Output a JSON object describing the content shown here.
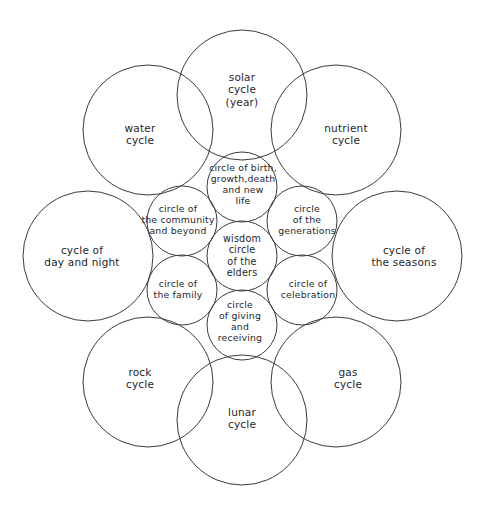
{
  "diagram": {
    "type": "overlapping-circles-venn",
    "stroke_color": "#3a3a44",
    "text_color": "#26262c",
    "background_color": "#ffffff",
    "geometry": {
      "center": [
        242,
        256
      ],
      "outer_radius": 65,
      "inner_radius": 35,
      "inner_ring_distance": 69,
      "outer_ring_distance": 161
    },
    "outer_circles": [
      {
        "id": "solar-cycle",
        "label": "solar\ncycle\n(year)",
        "cx": 242,
        "cy": 95,
        "r": 65,
        "label_x": 242,
        "label_y": 90
      },
      {
        "id": "nutrient-cycle",
        "label": "nutrient\ncycle",
        "cx": 336,
        "cy": 130,
        "r": 65,
        "label_x": 346,
        "label_y": 134
      },
      {
        "id": "cycle-of-seasons",
        "label": "cycle of\nthe seasons",
        "cx": 397,
        "cy": 256,
        "r": 65,
        "label_x": 404,
        "label_y": 256
      },
      {
        "id": "gas-cycle",
        "label": "gas\ncycle",
        "cx": 336,
        "cy": 382,
        "r": 65,
        "label_x": 348,
        "label_y": 378
      },
      {
        "id": "lunar-cycle",
        "label": "lunar\ncycle",
        "cx": 242,
        "cy": 420,
        "r": 65,
        "label_x": 242,
        "label_y": 418
      },
      {
        "id": "rock-cycle",
        "label": "rock\ncycle",
        "cx": 148,
        "cy": 382,
        "r": 65,
        "label_x": 140,
        "label_y": 378
      },
      {
        "id": "cycle-day-and-night",
        "label": "cycle  of\nday and night",
        "cx": 88,
        "cy": 256,
        "r": 65,
        "label_x": 82,
        "label_y": 256
      },
      {
        "id": "water-cycle",
        "label": "water\ncycle",
        "cx": 148,
        "cy": 130,
        "r": 65,
        "label_x": 140,
        "label_y": 134
      }
    ],
    "inner_circles": [
      {
        "id": "circle-of-birth-growth-death-new-life",
        "label": "circle of birth,\ngrowth,death\nand  new\nlife",
        "cx": 242,
        "cy": 187,
        "r": 35,
        "label_x": 243,
        "label_y": 185
      },
      {
        "id": "circle-of-the-generations",
        "label": "circle\nof  the\ngenerations",
        "cx": 302,
        "cy": 221,
        "r": 35,
        "label_x": 307,
        "label_y": 220
      },
      {
        "id": "circle-of-celebration",
        "label": "circle of\ncelebration",
        "cx": 302,
        "cy": 290,
        "r": 35,
        "label_x": 308,
        "label_y": 290
      },
      {
        "id": "circle-of-giving-and-receiving",
        "label": "circle\nof giving\nand\nreceiving",
        "cx": 242,
        "cy": 325,
        "r": 35,
        "label_x": 240,
        "label_y": 322
      },
      {
        "id": "circle-of-the-family",
        "label": "circle of\nthe  family",
        "cx": 182,
        "cy": 290,
        "r": 35,
        "label_x": 178,
        "label_y": 290
      },
      {
        "id": "circle-of-the-community-and-beyond",
        "label": "circle of\nthe community\nand beyond",
        "cx": 182,
        "cy": 221,
        "r": 35,
        "label_x": 178,
        "label_y": 220
      }
    ],
    "center_circle": {
      "id": "wisdom-circle-of-the-elders",
      "label": "wisdom\ncircle\nof  the\nelders",
      "cx": 242,
      "cy": 256,
      "r": 35,
      "label_x": 242,
      "label_y": 256
    }
  }
}
